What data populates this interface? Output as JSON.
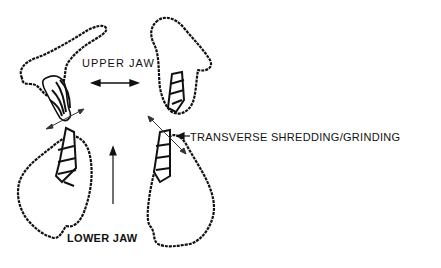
{
  "caption": "",
  "labels": {
    "upper_jaw": "UPPER JAW",
    "lower_jaw": "LOWER JAW",
    "transverse": "TRANSVERSE SHREDDING/GRINDING"
  },
  "arrows": {
    "upper_jaw": "double-headed horizontal arrow",
    "lower_jaw": "upward vertical arrow",
    "transverse": "leftward pointer arrow",
    "left_shear_line": "diagonal double arrow",
    "right_shear_line": "diagonal double arrow"
  },
  "colors": {
    "ink": "#111111",
    "background": "#ffffff"
  }
}
